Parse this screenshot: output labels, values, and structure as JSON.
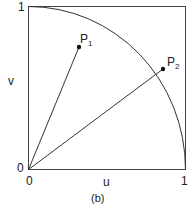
{
  "figure": {
    "caption": "(b)",
    "x_axis": {
      "label": "u",
      "tick_min": "0",
      "tick_max": "1"
    },
    "y_axis": {
      "label": "v",
      "tick_min": "0",
      "tick_max": "1"
    },
    "points": [
      {
        "name": "P",
        "sub": "1",
        "u": 0.33,
        "v": 0.75
      },
      {
        "name": "P",
        "sub": "2",
        "u": 0.86,
        "v": 0.61
      }
    ],
    "colors": {
      "stroke": "#333333",
      "text": "#222222"
    }
  }
}
